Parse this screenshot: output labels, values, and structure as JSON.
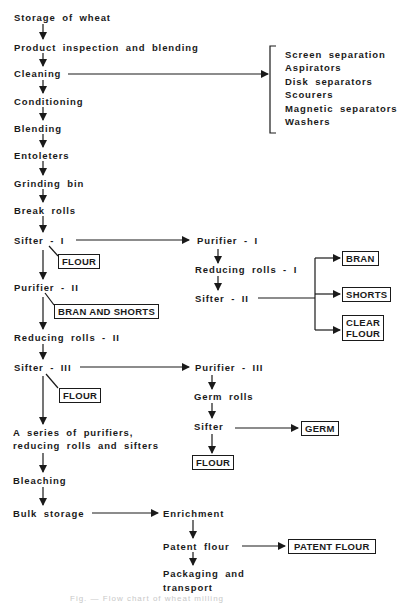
{
  "diagram": {
    "type": "flowchart",
    "main_flow": [
      "Storage of wheat",
      "Product inspection and blending",
      "Cleaning",
      "Conditioning",
      "Blending",
      "Entoleters",
      "Grinding bin",
      "Break rolls",
      "Sifter - I",
      "Purifier - II",
      "Reducing rolls - II",
      "Sifter - III",
      "A series of purifiers,",
      "reducing rolls and sifters",
      "Bleaching",
      "Bulk storage"
    ],
    "cleaning_methods": [
      "Screen separation",
      "Aspirators",
      "Disk separators",
      "Scourers",
      "Magnetic separators",
      "Washers"
    ],
    "branch_1": {
      "purifier": "Purifier - I",
      "reducing": "Reducing rolls - I",
      "sifter": "Sifter - II",
      "outputs": [
        "BRAN",
        "SHORTS",
        "CLEAR",
        "FLOUR"
      ]
    },
    "branch_3": {
      "purifier": "Purifier - III",
      "germ_rolls": "Germ rolls",
      "sifter": "Sifter",
      "germ_output": "GERM",
      "flour_output": "FLOUR"
    },
    "side_outputs": {
      "sifter1_flour": "FLOUR",
      "purifier2_bran_shorts": "BRAN AND SHORTS",
      "sifter3_flour": "FLOUR"
    },
    "final": {
      "enrichment": "Enrichment",
      "patent": "Patent flour",
      "patent_output": "PATENT FLOUR",
      "packaging_1": "Packaging and",
      "packaging_2": "transport"
    },
    "caption": "Fig. — Flow chart of wheat milling"
  }
}
